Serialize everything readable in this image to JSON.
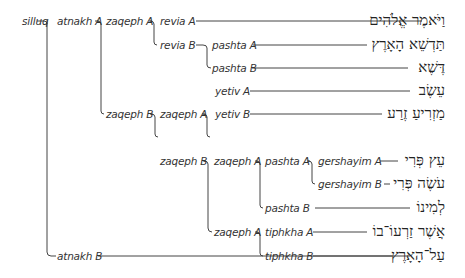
{
  "tree": {
    "root": "silluq",
    "nodes": {
      "silluq": "silluq",
      "atnakh_a": "atnakh A",
      "atnakh_b": "atnakh B",
      "zaqeph_a_1": "zaqeph A",
      "zaqeph_b_1": "zaqeph B",
      "revia_a": "revia A",
      "revia_b": "revia B",
      "pashta_a_1": "pashta A",
      "pashta_b_1": "pashta B",
      "zaqeph_a_2": "zaqeph A",
      "zaqeph_b_2": "zaqeph B",
      "yetiv_a": "yetiv A",
      "yetiv_b": "yetiv B",
      "zaqeph_a_3": "zaqeph A",
      "zaqeph_a_4": "zaqeph A",
      "pashta_a_2": "pashta A",
      "pashta_b_2": "pashta B",
      "gershayim_a": "gershayim A",
      "gershayim_b": "gershayim B",
      "tiphkha_a": "tiphkha A",
      "tiphkha_b": "tiphkha B"
    },
    "leaves": [
      "וַיֹּאמֶר אֱלֹהִים",
      "תַּדְשֵׁא הָאָרֶץ",
      "דֶּשֶׁא",
      "עֵשֶׂב",
      "מַזְרִיעַ זֶרַע",
      "עֵץ פְּרִי",
      "עֹשֶׂה פְּרִי",
      "לְמִינוֹ",
      "אֲשֶׁר זַרְעוֹ־בוֹ",
      "עַל־הָאָרֶץ",
      "וַיְהִי־כֵן׃"
    ]
  }
}
